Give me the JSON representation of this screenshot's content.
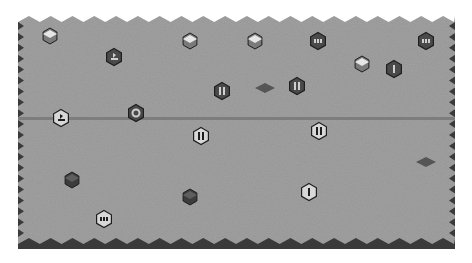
{
  "board": {
    "name": "hex-board",
    "colors": {
      "background": "#ffffff",
      "field": "#a3a3a3",
      "edge_dark": "#3a3a3a",
      "divider": "#7d7d7d",
      "cube_light_top": "#e6e6e6",
      "cube_light_side": "#7a7a7a",
      "cube_dark_top": "#5e5e5e",
      "cube_dark_side": "#3c3c3c",
      "token_dark": "#4a4a4a",
      "token_light": "#d8d8d8",
      "diamond": "#555555",
      "outline": "#1e1e1e"
    },
    "bounds": {
      "left": 18,
      "top": 18,
      "right": 455,
      "bottom": 248
    },
    "divider_y": 118
  },
  "pieces": [
    {
      "id": "p1",
      "type": "cube-light",
      "x": 50,
      "y": 36
    },
    {
      "id": "p2",
      "type": "token-dark",
      "symbol": "flag",
      "x": 114,
      "y": 57
    },
    {
      "id": "p3",
      "type": "cube-light",
      "x": 190,
      "y": 41
    },
    {
      "id": "p4",
      "type": "cube-light",
      "x": 255,
      "y": 41
    },
    {
      "id": "p5",
      "type": "token-dark",
      "symbol": "three-bars",
      "x": 318,
      "y": 41
    },
    {
      "id": "p6",
      "type": "token-dark",
      "symbol": "three-bars",
      "x": 426,
      "y": 41
    },
    {
      "id": "p7",
      "type": "cube-light",
      "x": 362,
      "y": 64
    },
    {
      "id": "p8",
      "type": "token-dark",
      "symbol": "one-bar",
      "x": 394,
      "y": 69
    },
    {
      "id": "p9",
      "type": "token-dark",
      "symbol": "two-bars",
      "x": 222,
      "y": 91
    },
    {
      "id": "p10",
      "type": "diamond",
      "x": 265,
      "y": 88
    },
    {
      "id": "p11",
      "type": "token-dark",
      "symbol": "two-bars",
      "x": 297,
      "y": 86
    },
    {
      "id": "p12",
      "type": "token-light",
      "symbol": "flag",
      "x": 61,
      "y": 118
    },
    {
      "id": "p13",
      "type": "token-dark",
      "symbol": "ring",
      "x": 136,
      "y": 113
    },
    {
      "id": "p14",
      "type": "token-light",
      "symbol": "two-bars",
      "x": 201,
      "y": 136
    },
    {
      "id": "p15",
      "type": "token-light",
      "symbol": "two-bars",
      "x": 319,
      "y": 131
    },
    {
      "id": "p16",
      "type": "diamond",
      "x": 426,
      "y": 162
    },
    {
      "id": "p17",
      "type": "cube-dark",
      "x": 72,
      "y": 180
    },
    {
      "id": "p18",
      "type": "cube-dark",
      "x": 190,
      "y": 197
    },
    {
      "id": "p19",
      "type": "token-light",
      "symbol": "one-bar",
      "x": 309,
      "y": 192
    },
    {
      "id": "p20",
      "type": "token-light",
      "symbol": "three-bars",
      "x": 104,
      "y": 219
    }
  ]
}
